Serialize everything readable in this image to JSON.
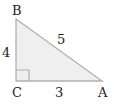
{
  "diagram": {
    "type": "right-triangle",
    "colors": {
      "fill": "#efefef",
      "stroke": "#b0b0b0",
      "text": "#222222"
    },
    "vertices": {
      "A": {
        "label": "A",
        "x": 102,
        "y": 81
      },
      "B": {
        "label": "B",
        "x": 16,
        "y": 19
      },
      "C": {
        "label": "C",
        "x": 16,
        "y": 81
      }
    },
    "sides": {
      "BC": {
        "label": "4"
      },
      "AB": {
        "label": "5"
      },
      "CA": {
        "label": "3"
      }
    },
    "right_angle_at": "C"
  }
}
